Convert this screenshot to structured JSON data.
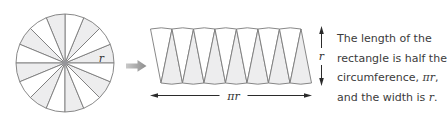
{
  "labels": {
    "circle_radius": "r",
    "strip_length": "πr",
    "strip_width": "r"
  },
  "diagram": {
    "circle_sector_count": 16,
    "strip_triangle_count": 14
  },
  "caption": {
    "lines": [
      [
        {
          "t": "The length of the"
        }
      ],
      [
        {
          "t": "rectangle is half the"
        }
      ],
      [
        {
          "t": "circumference, "
        },
        {
          "t": "πr",
          "math": true
        },
        {
          "t": ","
        }
      ],
      [
        {
          "t": "and the width is "
        },
        {
          "t": "r",
          "math": true
        },
        {
          "t": "."
        }
      ]
    ]
  },
  "colors": {
    "outline": "#7a7a7a",
    "sector_fill": "#ededee",
    "white_fill": "#ffffff",
    "center_dot": "#96969a",
    "arrow_icon_light": "#c9c9c9",
    "arrow_icon_dark": "#8d8d8d",
    "dimension": "#2b2b2b",
    "text": "#3b3b3b"
  }
}
